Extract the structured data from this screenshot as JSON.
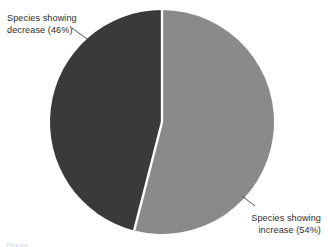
{
  "figure": {
    "background_color": "#ffffff",
    "width": 328,
    "height": 244
  },
  "labels": {
    "decrease": {
      "line1": "Species showing",
      "line2": "decrease (46%)"
    },
    "increase": {
      "line1": "Species showing",
      "line2": "increase (54%)"
    }
  },
  "caption": {
    "text": "Figure"
  },
  "chart_data": {
    "type": "pie",
    "title": "",
    "categories": [
      "Species showing decrease",
      "Species showing increase"
    ],
    "values": [
      46,
      54
    ],
    "units": "%",
    "labels": [
      "Species showing decrease (46%)",
      "Species showing increase (54%)"
    ],
    "colors": [
      "#3a3a3a",
      "#8a8a8a"
    ],
    "slice_separator_color": "#ffffff",
    "legend": "none",
    "annotations": [
      {
        "text": "Species showing decrease (46%)",
        "position": "top-left",
        "leader_line": true
      },
      {
        "text": "Species showing increase (54%)",
        "position": "bottom-right",
        "leader_line": true
      }
    ],
    "geometry": {
      "center_x": 162,
      "center_y": 122,
      "radius": 112,
      "start_angle_deg": 0,
      "direction": "clockwise"
    },
    "grid": false,
    "xlabel": "",
    "ylabel": ""
  },
  "colors": {
    "slice_decrease": "#3a3a3a",
    "slice_increase": "#8a8a8a",
    "separator": "#ffffff",
    "leader_line": "#3d3d3d",
    "text": "#2d2d2d"
  }
}
